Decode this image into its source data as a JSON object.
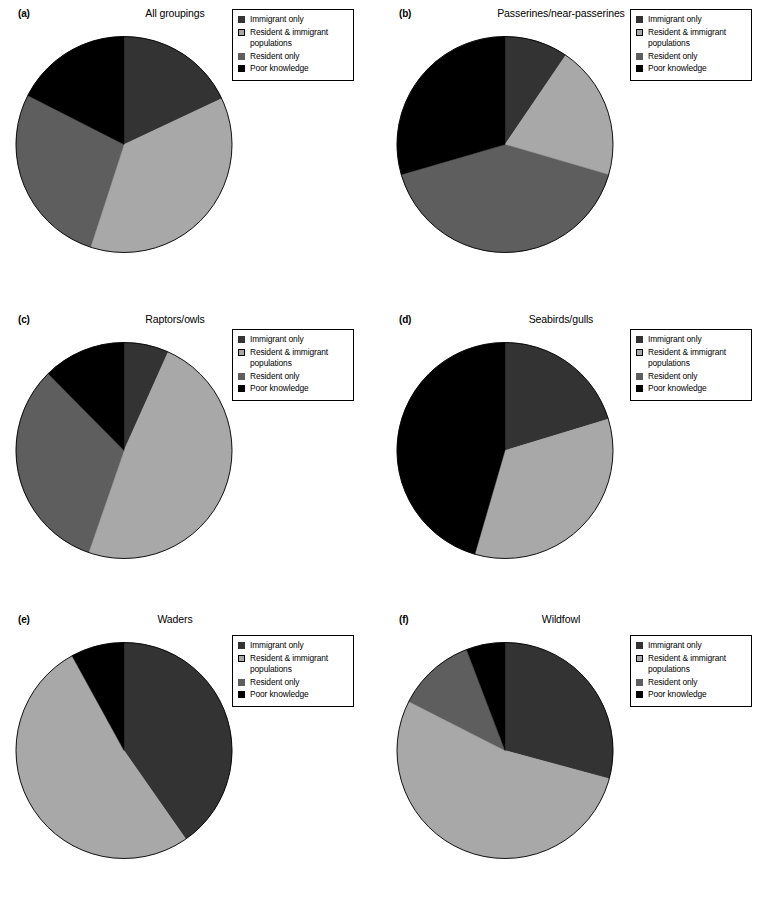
{
  "figure": {
    "background": "#ffffff",
    "colors": {
      "immigrant_only": "#333333",
      "resident_and_immigrant": "#a8a8a8",
      "resident_only": "#5e5e5e",
      "poor_knowledge": "#000000",
      "outline": "#000000"
    },
    "legend_labels": [
      "Immigrant only",
      "Resident & immigrant\npopulations",
      "Resident only",
      "Poor knowledge"
    ]
  },
  "chart_data": [
    {
      "type": "pie",
      "panel": "a",
      "panel_label": "(a)",
      "title": "All groupings",
      "categories": [
        "Immigrant only",
        "Resident & immigrant populations",
        "Resident only",
        "Poor knowledge"
      ],
      "colors": [
        "#333333",
        "#a8a8a8",
        "#5e5e5e",
        "#000000"
      ],
      "values": [
        18,
        37,
        27.5,
        17.5
      ],
      "start_angle_deg": 0,
      "direction": "clockwise",
      "legend_position": "top-right"
    },
    {
      "type": "pie",
      "panel": "b",
      "panel_label": "(b)",
      "title": "Passerines/near-passerines",
      "categories": [
        "Immigrant only",
        "Resident & immigrant populations",
        "Resident only",
        "Poor knowledge"
      ],
      "colors": [
        "#333333",
        "#a8a8a8",
        "#5e5e5e",
        "#000000"
      ],
      "values": [
        9.5,
        20,
        41,
        29.5
      ],
      "start_angle_deg": 0,
      "direction": "clockwise",
      "legend_position": "top-right"
    },
    {
      "type": "pie",
      "panel": "c",
      "panel_label": "(c)",
      "title": "Raptors/owls",
      "categories": [
        "Immigrant only",
        "Resident & immigrant populations",
        "Resident only",
        "Poor knowledge"
      ],
      "colors": [
        "#333333",
        "#a8a8a8",
        "#5e5e5e",
        "#000000"
      ],
      "values": [
        6.7,
        48.6,
        32.3,
        12.4
      ],
      "start_angle_deg": 0,
      "direction": "clockwise",
      "legend_position": "top-right"
    },
    {
      "type": "pie",
      "panel": "d",
      "panel_label": "(d)",
      "title": "Seabirds/gulls",
      "categories": [
        "Immigrant only",
        "Resident & immigrant populations",
        "Resident only",
        "Poor knowledge"
      ],
      "colors": [
        "#333333",
        "#a8a8a8",
        "#5e5e5e",
        "#000000"
      ],
      "values": [
        20.3,
        34.2,
        0,
        45.5
      ],
      "start_angle_deg": 0,
      "direction": "clockwise",
      "legend_position": "top-right"
    },
    {
      "type": "pie",
      "panel": "e",
      "panel_label": "(e)",
      "title": "Waders",
      "categories": [
        "Immigrant only",
        "Resident & immigrant populations",
        "Resident only",
        "Poor knowledge"
      ],
      "colors": [
        "#333333",
        "#a8a8a8",
        "#5e5e5e",
        "#000000"
      ],
      "values": [
        40.3,
        51.7,
        0,
        8.0
      ],
      "start_angle_deg": 0,
      "direction": "clockwise",
      "legend_position": "top-right"
    },
    {
      "type": "pie",
      "panel": "f",
      "panel_label": "(f)",
      "title": "Wildfowl",
      "categories": [
        "Immigrant only",
        "Resident & immigrant populations",
        "Resident only",
        "Poor knowledge"
      ],
      "colors": [
        "#333333",
        "#a8a8a8",
        "#5e5e5e",
        "#000000"
      ],
      "values": [
        29.2,
        53.3,
        11.7,
        5.8
      ],
      "start_angle_deg": 0,
      "direction": "clockwise",
      "legend_position": "top-right"
    }
  ]
}
